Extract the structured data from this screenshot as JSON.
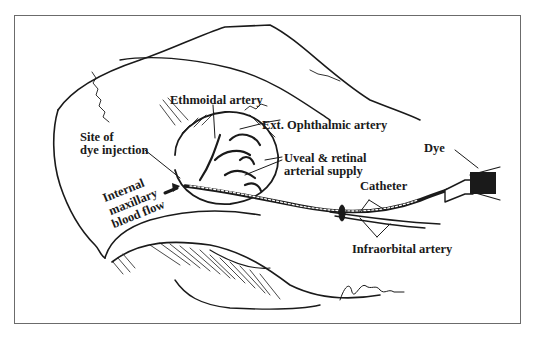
{
  "figure": {
    "type": "anatomical illustration",
    "colors": {
      "ink": "#1a1a1a",
      "frame": "#6b6b6b",
      "background": "#ffffff"
    },
    "labels": {
      "ethmoidal_artery": "Ethmoidal artery",
      "ext_ophthalmic_artery": "Ext. Ophthalmic artery",
      "site_of_injection_line1": "Site of",
      "site_of_injection_line2": "dye injection",
      "uveal_line1": "Uveal & retinal",
      "uveal_line2": "arterial supply",
      "internal_line1": "Internal",
      "internal_line2": "maxillary",
      "internal_line3": "blood flow",
      "catheter": "Catheter",
      "dye": "Dye",
      "infraorbital_artery": "Infraorbital artery"
    }
  }
}
